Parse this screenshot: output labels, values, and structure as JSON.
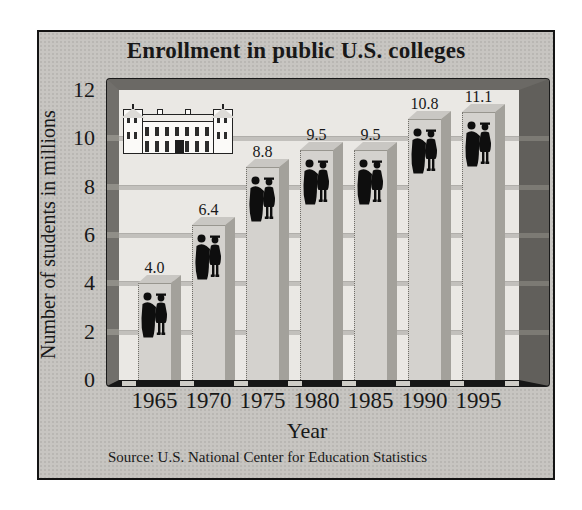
{
  "page": {
    "background": "#ffffff"
  },
  "chart_panel": {
    "border_color": "#141414",
    "background": "#c7c5c1"
  },
  "chart_data": {
    "type": "bar",
    "title": "Enrollment in public U.S. colleges",
    "categories": [
      "1965",
      "1970",
      "1975",
      "1980",
      "1985",
      "1990",
      "1995"
    ],
    "values": [
      4.0,
      6.4,
      8.8,
      9.5,
      9.5,
      10.8,
      11.1
    ],
    "value_labels": [
      "4.0",
      "6.4",
      "8.8",
      "9.5",
      "9.5",
      "10.8",
      "11.1"
    ],
    "xlabel": "Year",
    "ylabel": "Number of students in millions",
    "ylim": [
      0,
      12
    ],
    "yticks": [
      0,
      2,
      4,
      6,
      8,
      10,
      12
    ],
    "gridlines_at": [
      2,
      4,
      6,
      8,
      10
    ],
    "legend": "none",
    "grid": "horizontal",
    "source": "Source: U.S. National Center for Education Statistics",
    "bar_color": "#d4d2ce",
    "bar_side_color": "#a3a19b",
    "bar_top_color": "#c9c7c3",
    "figure_color": "#0e0e0e",
    "frame_color": "#6b6965",
    "plot_background": "#eae8e4",
    "gridline_color": "#c2c0bc",
    "text_color": "#181818"
  },
  "decorations": {
    "building_icon": "college-building-line-drawing",
    "per_bar_icon": "two-graduates-silhouette"
  }
}
